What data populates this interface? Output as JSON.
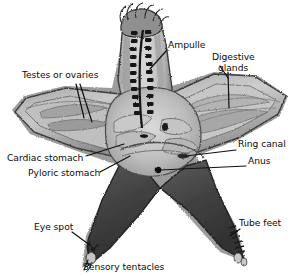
{
  "figure": {
    "background_color": "#ffffff",
    "width": 300,
    "height": 276
  },
  "palette": {
    "background": "#ffffff",
    "label_text": "#0d0d0d",
    "leader_line": "#101010",
    "body_dark": "#3a3a3a",
    "body_mid": "#8e8e8e",
    "body_light": "#c2c2c2",
    "body_pale": "#d8d8d8",
    "outline": "#2a2a2a",
    "canal_dark": "#1c1c1c",
    "anus_dot": "#080808"
  },
  "labels": [
    {
      "id": "ampulle",
      "text": "Ampulle",
      "lines": [
        "Ampulle"
      ],
      "x": 168,
      "y": 44,
      "leader": "line from label left down-left to ampullae on upper arm"
    },
    {
      "id": "digestive-glands",
      "text": "Digestive glands",
      "lines": [
        "Digestive",
        "glands"
      ],
      "x": 212,
      "y": 56,
      "leader": "forked line down to digestive glands in right arm"
    },
    {
      "id": "testes-or-ovaries",
      "text": "Testes or ovaries",
      "lines": [
        "Testes or ovaries"
      ],
      "x": 22,
      "y": 74,
      "leader": "forked line down-right to gonads in left arm"
    },
    {
      "id": "ring-canal",
      "text": "Ring canal",
      "lines": [
        "Ring canal"
      ],
      "x": 238,
      "y": 144,
      "leader": "horizontal line left to ring canal at central disc"
    },
    {
      "id": "anus",
      "text": "Anus",
      "lines": [
        "Anus"
      ],
      "x": 248,
      "y": 161,
      "leader": "horizontal line left to black anus dot on central disc"
    },
    {
      "id": "cardiac-stomach",
      "text": "Cardiac stomach",
      "lines": [
        "Cardiac stomach"
      ],
      "x": 8,
      "y": 158,
      "leader": "line right to cardiac stomach near disc center"
    },
    {
      "id": "pyloric-stomach",
      "text": "Pyloric stomach",
      "lines": [
        "Pyloric stomach"
      ],
      "x": 28,
      "y": 173,
      "leader": "line right to pyloric stomach near disc center"
    },
    {
      "id": "eye-spot",
      "text": "Eye spot",
      "lines": [
        "Eye spot"
      ],
      "x": 35,
      "y": 227,
      "leader": "line down-right to arm tip eye spot"
    },
    {
      "id": "tube-feet",
      "text": "Tube feet",
      "lines": [
        "Tube feet"
      ],
      "x": 238,
      "y": 223,
      "leader": "line down-left to tube feet on lower right arm"
    },
    {
      "id": "sensory-tentacles",
      "text": "Sensory tentacles",
      "lines": [
        "Sensory tentacles"
      ],
      "x": 83,
      "y": 263,
      "leader": "line up to sensory tentacles at lower left arm tip"
    }
  ],
  "anatomy_parts": [
    {
      "id": "upper-arm",
      "name": "upper arm with radial canal and ampullae"
    },
    {
      "id": "left-arm",
      "name": "left arm showing gonads"
    },
    {
      "id": "right-arm",
      "name": "right arm showing digestive glands"
    },
    {
      "id": "lower-left-arm",
      "name": "lower left arm (aboral surface, dark)"
    },
    {
      "id": "lower-right-arm",
      "name": "lower right arm (aboral surface, dark)"
    },
    {
      "id": "central-disc",
      "name": "central disc with stomachs, ring canal, anus"
    },
    {
      "id": "ampullae-row",
      "name": "paired ampullae along radial canal"
    },
    {
      "id": "tube-feet-row",
      "name": "tube feet projections on lower right arm"
    },
    {
      "id": "sensory-tentacles-tip",
      "name": "sensory tentacles at arm tip"
    }
  ]
}
